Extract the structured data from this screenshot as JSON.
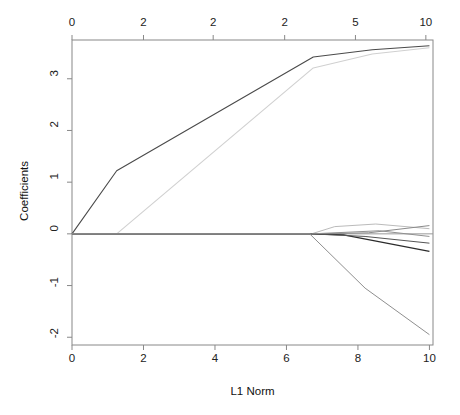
{
  "chart_data": {
    "type": "line",
    "title": "",
    "xlabel": "L1 Norm",
    "ylabel": "Coefficients",
    "xlim": [
      0,
      10.1
    ],
    "ylim": [
      -2.15,
      3.75
    ],
    "grid": false,
    "legend": "none",
    "top_axis": {
      "label": "",
      "ticks": [
        {
          "label": "0",
          "x": 0.0
        },
        {
          "label": "2",
          "x": 2.0
        },
        {
          "label": "2",
          "x": 3.95
        },
        {
          "label": "2",
          "x": 5.95
        },
        {
          "label": "5",
          "x": 7.93
        },
        {
          "label": "10",
          "x": 9.9
        }
      ]
    },
    "bottom_axis": {
      "label": "L1 Norm",
      "ticks": [
        {
          "label": "0",
          "x": 0
        },
        {
          "label": "2",
          "x": 2
        },
        {
          "label": "4",
          "x": 4
        },
        {
          "label": "6",
          "x": 6
        },
        {
          "label": "8",
          "x": 8
        },
        {
          "label": "10",
          "x": 10
        }
      ]
    },
    "left_axis": {
      "label": "Coefficients",
      "ticks": [
        {
          "label": "3",
          "y": 3
        },
        {
          "label": "2",
          "y": 2
        },
        {
          "label": "1",
          "y": 1
        },
        {
          "label": "0",
          "y": 0
        },
        {
          "label": "-1",
          "y": -1
        },
        {
          "label": "-2",
          "y": -2
        }
      ]
    },
    "zero_reference_line": 0,
    "series": [
      {
        "name": "coef-path-1",
        "color": "#4a4a4a",
        "width": 1.1,
        "points": [
          [
            0.0,
            0.0
          ],
          [
            1.25,
            1.22
          ],
          [
            6.75,
            3.42
          ],
          [
            8.4,
            3.56
          ],
          [
            10.0,
            3.64
          ]
        ]
      },
      {
        "name": "coef-path-2",
        "color": "#d0d0d0",
        "width": 1.1,
        "points": [
          [
            0.0,
            0.0
          ],
          [
            1.25,
            0.0
          ],
          [
            6.75,
            3.21
          ],
          [
            8.4,
            3.48
          ],
          [
            10.0,
            3.6
          ]
        ]
      },
      {
        "name": "coef-path-3",
        "color": "#bbbbbb",
        "width": 1.0,
        "points": [
          [
            0.0,
            0.0
          ],
          [
            6.7,
            0.0
          ],
          [
            7.35,
            0.14
          ],
          [
            8.5,
            0.19
          ],
          [
            10.0,
            0.1
          ]
        ]
      },
      {
        "name": "coef-path-4",
        "color": "#8a8a8a",
        "width": 1.0,
        "points": [
          [
            0.0,
            0.0
          ],
          [
            6.7,
            0.0
          ],
          [
            8.3,
            0.02
          ],
          [
            10.0,
            0.16
          ]
        ]
      },
      {
        "name": "coef-path-5",
        "color": "#2b2b2b",
        "width": 1.2,
        "points": [
          [
            0.0,
            0.0
          ],
          [
            6.7,
            0.0
          ],
          [
            7.6,
            -0.02
          ],
          [
            10.0,
            -0.34
          ]
        ]
      },
      {
        "name": "coef-path-6",
        "color": "#555555",
        "width": 1.0,
        "points": [
          [
            0.0,
            0.0
          ],
          [
            6.7,
            0.0
          ],
          [
            8.2,
            -0.05
          ],
          [
            10.0,
            -0.18
          ]
        ]
      },
      {
        "name": "coef-path-7",
        "color": "#909090",
        "width": 1.0,
        "points": [
          [
            0.0,
            0.0
          ],
          [
            6.7,
            0.0
          ],
          [
            8.6,
            0.06
          ],
          [
            10.0,
            -0.05
          ]
        ]
      },
      {
        "name": "coef-path-8",
        "color": "#8f8f8f",
        "width": 1.0,
        "points": [
          [
            0.0,
            0.0
          ],
          [
            6.65,
            0.0
          ],
          [
            8.2,
            -1.05
          ],
          [
            10.0,
            -1.95
          ]
        ]
      }
    ]
  }
}
